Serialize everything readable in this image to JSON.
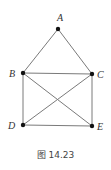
{
  "figure": {
    "caption": "图 14.23",
    "nodes": [
      {
        "id": "A",
        "label": "A",
        "x": 58,
        "y": 29,
        "label_x": 57,
        "label_y": 21
      },
      {
        "id": "B",
        "label": "B",
        "x": 23,
        "y": 73,
        "label_x": 9,
        "label_y": 77
      },
      {
        "id": "C",
        "label": "C",
        "x": 92,
        "y": 74,
        "label_x": 97,
        "label_y": 78
      },
      {
        "id": "D",
        "label": "D",
        "x": 23,
        "y": 125,
        "label_x": 8,
        "label_y": 129
      },
      {
        "id": "E",
        "label": "E",
        "x": 92,
        "y": 126,
        "label_x": 97,
        "label_y": 130
      }
    ],
    "edges": [
      [
        "A",
        "B"
      ],
      [
        "A",
        "C"
      ],
      [
        "B",
        "C"
      ],
      [
        "B",
        "D"
      ],
      [
        "B",
        "E"
      ],
      [
        "C",
        "D"
      ],
      [
        "C",
        "E"
      ],
      [
        "D",
        "E"
      ]
    ],
    "colors": {
      "edge": "#7a7a7a",
      "node": "#111111",
      "label": "#333333"
    }
  }
}
